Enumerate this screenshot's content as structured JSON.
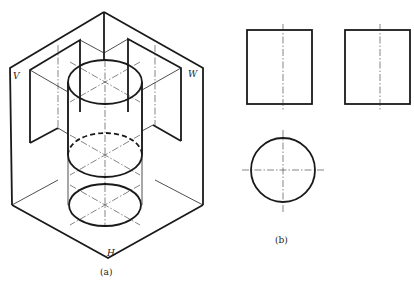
{
  "header_fragment": "",
  "figure_a": {
    "caption": "(a)",
    "plane_labels": {
      "v": "V",
      "w": "W",
      "h": "H"
    }
  },
  "figure_b": {
    "caption": "(b)",
    "views": [
      "front-view-rectangle",
      "side-view-rectangle",
      "top-view-circle"
    ]
  },
  "colors": {
    "line": "#1a1a1a",
    "background": "#ffffff"
  }
}
